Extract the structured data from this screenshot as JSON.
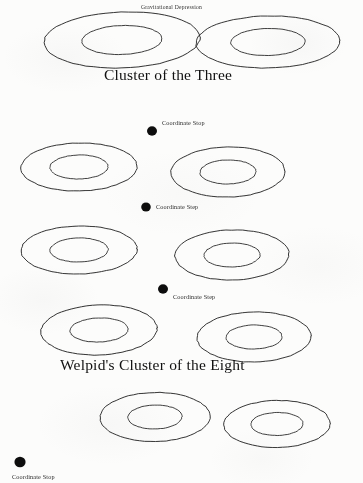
{
  "document": {
    "kind": "scanned-hand-drawn-diagram",
    "page_width": 363,
    "page_height": 483,
    "background_color": "#fcfcfb",
    "ink_color": "#151515"
  },
  "labels": {
    "gravitational_depression": "Gravitational Depression",
    "cluster_of_the_three": "Cluster of the Three",
    "welpids_cluster_of_the_eight": "Welpid's Cluster of the Eight",
    "coordinate_stop": "Coordinate Stop",
    "coordinate_step": "Coordinate Step"
  },
  "annotations": [
    {
      "id": "annot-gravitational-depression",
      "text": "Gravitational Depression",
      "x": 141,
      "y": 4,
      "style": "tiny-title",
      "marker": false
    },
    {
      "id": "annot-coordinate-stop-1",
      "text": "Coordinate Stop",
      "x": 162,
      "y": 119,
      "style": "annot",
      "marker": true,
      "marker_x": 152,
      "marker_y": 131,
      "marker_r": 5.0
    },
    {
      "id": "annot-coordinate-step-1",
      "text": "Coordinate Step",
      "x": 156,
      "y": 203,
      "style": "annot",
      "marker": true,
      "marker_x": 146,
      "marker_y": 207,
      "marker_r": 4.8
    },
    {
      "id": "annot-coordinate-step-2",
      "text": "Coordinate Step",
      "x": 173,
      "y": 293,
      "style": "annot",
      "marker": true,
      "marker_x": 163,
      "marker_y": 289,
      "marker_r": 5.0
    },
    {
      "id": "annot-coordinate-stop-2",
      "text": "Coordinate Stop",
      "x": 12,
      "y": 473,
      "style": "annot",
      "marker": true,
      "marker_x": 20,
      "marker_y": 462,
      "marker_r": 5.6
    }
  ],
  "headings": [
    {
      "id": "heading-cluster-of-the-three",
      "text": "Cluster of the Three",
      "x": 104,
      "y": 66
    },
    {
      "id": "heading-welpids-cluster-eight",
      "text": "Welpid's Cluster of the Eight",
      "x": 60,
      "y": 356
    }
  ],
  "chart_data": {
    "type": "scatter",
    "title": "Welpid's Cluster of the Eight",
    "subtitle": "Cluster of the Three",
    "xlabel": "",
    "ylabel": "",
    "grid": false,
    "legend": "none",
    "series": [
      {
        "name": "Gravitational Depression Wells",
        "marker": "concentric-ellipse",
        "points": [
          {
            "id": "well-1",
            "row": 1,
            "cx": 122,
            "cy": 40,
            "rx": 78,
            "ry": 28,
            "inner_rx": 40,
            "inner_ry": 14.5,
            "rot": -2
          },
          {
            "id": "well-2",
            "row": 1,
            "cx": 268,
            "cy": 42,
            "rx": 72,
            "ry": 26,
            "inner_rx": 37,
            "inner_ry": 13.5,
            "rot": -1
          },
          {
            "id": "well-3",
            "row": 2,
            "cx": 79,
            "cy": 167,
            "rx": 58,
            "ry": 24,
            "inner_rx": 29,
            "inner_ry": 12,
            "rot": -1
          },
          {
            "id": "well-4",
            "row": 2,
            "cx": 228,
            "cy": 172,
            "rx": 57,
            "ry": 25,
            "inner_rx": 28,
            "inner_ry": 12,
            "rot": -1
          },
          {
            "id": "well-5",
            "row": 3,
            "cx": 79,
            "cy": 250,
            "rx": 58,
            "ry": 24,
            "inner_rx": 29,
            "inner_ry": 12,
            "rot": -1
          },
          {
            "id": "well-6",
            "row": 3,
            "cx": 232,
            "cy": 255,
            "rx": 57,
            "ry": 25,
            "inner_rx": 28,
            "inner_ry": 12,
            "rot": -1
          },
          {
            "id": "well-7",
            "row": 4,
            "cx": 99,
            "cy": 330,
            "rx": 58,
            "ry": 25,
            "inner_rx": 29,
            "inner_ry": 12,
            "rot": -2
          },
          {
            "id": "well-8",
            "row": 4,
            "cx": 254,
            "cy": 337,
            "rx": 57,
            "ry": 25,
            "inner_rx": 28,
            "inner_ry": 12,
            "rot": -1
          },
          {
            "id": "well-9",
            "row": 5,
            "cx": 155,
            "cy": 417,
            "rx": 55,
            "ry": 24.5,
            "inner_rx": 27,
            "inner_ry": 12,
            "rot": -1
          },
          {
            "id": "well-10",
            "row": 5,
            "cx": 277,
            "cy": 424,
            "rx": 53,
            "ry": 23.5,
            "inner_rx": 26,
            "inner_ry": 11.5,
            "rot": -1
          }
        ]
      },
      {
        "name": "Coordinate Stops / Steps",
        "marker": "filled-dot",
        "points": [
          {
            "id": "dot-1",
            "cx": 152,
            "cy": 131,
            "r": 5.0,
            "label": "Coordinate Stop"
          },
          {
            "id": "dot-2",
            "cx": 146,
            "cy": 207,
            "r": 4.8,
            "label": "Coordinate Step"
          },
          {
            "id": "dot-3",
            "cx": 163,
            "cy": 289,
            "r": 5.0,
            "label": "Coordinate Step"
          },
          {
            "id": "dot-4",
            "cx": 20,
            "cy": 462,
            "r": 5.6,
            "label": "Coordinate Stop"
          }
        ]
      }
    ]
  }
}
